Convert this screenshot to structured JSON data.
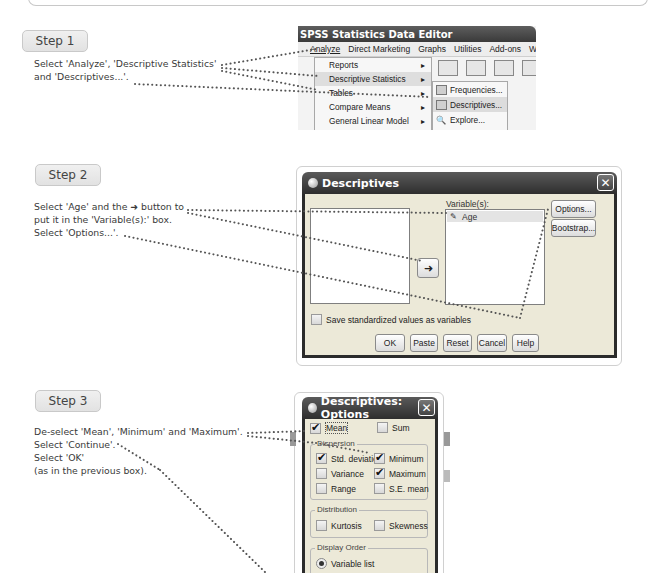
{
  "steps": [
    {
      "label": "Step 1",
      "instructions": [
        "Select 'Analyze', 'Descriptive Statistics'",
        "and 'Descriptives...'."
      ]
    },
    {
      "label": "Step 2",
      "instructions": [
        "Select 'Age' and the ➜ button to",
        "put it in the 'Variable(s):' box.",
        "Select 'Options...'."
      ]
    },
    {
      "label": "Step 3",
      "instructions": [
        "De-select 'Mean', 'Minimum' and 'Maximum'.",
        "Select 'Continue'.",
        "Select 'OK'",
        "(as in the previous box)."
      ]
    }
  ],
  "spss_editor": {
    "title": "SPSS Statistics Data Editor",
    "menu": [
      "Analyze",
      "Direct Marketing",
      "Graphs",
      "Utilities",
      "Add-ons",
      "Windo"
    ],
    "analyze_menu": [
      {
        "label": "Reports",
        "submenu": true
      },
      {
        "label": "Descriptive Statistics",
        "submenu": true,
        "highlighted": true
      },
      {
        "label": "Tables",
        "submenu": true
      },
      {
        "label": "Compare Means",
        "submenu": true
      },
      {
        "label": "General Linear Model",
        "submenu": true
      },
      {
        "label": "Generalized Linear Models",
        "submenu": true
      }
    ],
    "descriptive_submenu": [
      "Frequencies...",
      "Descriptives...",
      "Explore...",
      "Crosstabs..."
    ]
  },
  "descriptives_dialog": {
    "title": "Descriptives",
    "variables_label": "Variable(s):",
    "variables": [
      "Age"
    ],
    "options_button": "Options...",
    "bootstrap_button": "Bootstrap...",
    "arrow_icon": "➜",
    "save_checkbox": "Save standardized values as variables",
    "buttons": [
      "OK",
      "Paste",
      "Reset",
      "Cancel",
      "Help"
    ]
  },
  "options_dialog": {
    "title": "Descriptives: Options",
    "mean": {
      "label": "Mean",
      "checked": true
    },
    "sum": {
      "label": "Sum",
      "checked": false
    },
    "dispersion_label": "Dispersion",
    "dispersion": [
      {
        "label": "Std. deviation",
        "checked": true
      },
      {
        "label": "Minimum",
        "checked": true
      },
      {
        "label": "Variance",
        "checked": false
      },
      {
        "label": "Maximum",
        "checked": true
      },
      {
        "label": "Range",
        "checked": false
      },
      {
        "label": "S.E. mean",
        "checked": false
      }
    ],
    "distribution_label": "Distribution",
    "distribution": [
      {
        "label": "Kurtosis",
        "checked": false
      },
      {
        "label": "Skewness",
        "checked": false
      }
    ],
    "display_order_label": "Display Order",
    "display_order_selected": "Variable list"
  }
}
